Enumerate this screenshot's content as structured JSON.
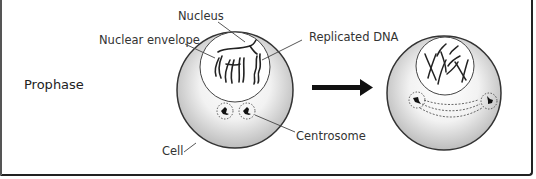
{
  "diagram": {
    "phase_label": "Prophase",
    "labels": {
      "nucleus": "Nucleus",
      "nuclear_envelope": "Nuclear envelope",
      "replicated_dna": "Replicated DNA",
      "centrosome": "Centrosome",
      "cell": "Cell"
    },
    "stages": [
      {
        "name": "early-prophase",
        "description": "Nucleus with replicated DNA; two centrosomes adjacent"
      },
      {
        "name": "late-prophase",
        "description": "Condensed chromosomes; centrosomes separating with spindle fibers"
      }
    ],
    "arrow": "right-arrow",
    "colors": {
      "outline": "#333333",
      "cell_fill_center": "#ffffff",
      "cell_fill_edge": "#c8c8c8",
      "text": "#333333"
    }
  }
}
